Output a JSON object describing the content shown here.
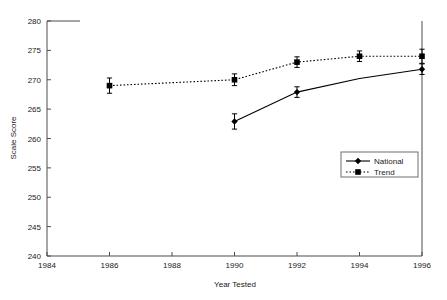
{
  "chart_data": {
    "type": "line",
    "title": "",
    "xlabel": "Year Tested",
    "ylabel": "Scale Score",
    "xlim": [
      1984,
      1996
    ],
    "ylim": [
      240,
      280
    ],
    "xticks": [
      1984,
      1986,
      1988,
      1990,
      1992,
      1994,
      1996
    ],
    "yticks": [
      240,
      245,
      250,
      255,
      260,
      265,
      270,
      275,
      280
    ],
    "grid": false,
    "legend_position": "inside-right",
    "series": [
      {
        "name": "National",
        "line_style": "solid",
        "marker": "diamond",
        "color": "#000000",
        "x": [
          1990,
          1992,
          1994,
          1996
        ],
        "values": [
          262.9,
          267.9,
          270.2,
          271.8
        ],
        "errors": [
          1.3,
          0.9,
          0.0,
          0.9
        ],
        "markers_shown": [
          true,
          true,
          false,
          true
        ]
      },
      {
        "name": "Trend",
        "line_style": "dotted",
        "marker": "square",
        "color": "#000000",
        "x": [
          1986,
          1990,
          1992,
          1994,
          1996
        ],
        "values": [
          269.0,
          270.0,
          273.0,
          274.0,
          274.0
        ],
        "errors": [
          1.3,
          1.0,
          0.9,
          0.9,
          1.2
        ],
        "markers_shown": [
          true,
          true,
          true,
          true,
          true
        ]
      }
    ]
  },
  "axes": {
    "y_tick_labels": [
      "280",
      "275",
      "270",
      "265",
      "260",
      "255",
      "250",
      "245",
      "240"
    ],
    "x_tick_labels": [
      "1984",
      "1986",
      "1988",
      "1990",
      "1992",
      "1994",
      "1996"
    ],
    "y_axis_title": "Scale Score",
    "x_axis_title": "Year Tested"
  },
  "legend": {
    "items": [
      {
        "label": "National",
        "style": "solid",
        "marker": "diamond"
      },
      {
        "label": "Trend",
        "style": "dotted",
        "marker": "square"
      }
    ]
  },
  "colors": {
    "axis": "#4d4d4d",
    "series": "#000000",
    "legend_border": "#6e6e6e",
    "background": "#ffffff"
  }
}
